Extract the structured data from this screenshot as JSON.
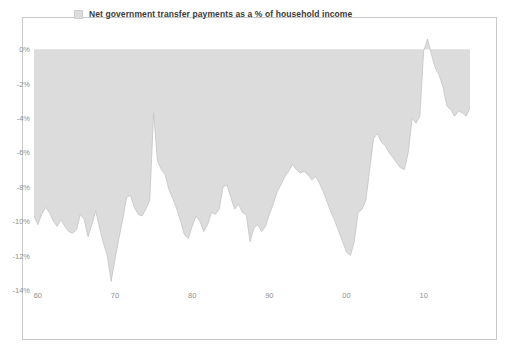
{
  "chart_data": {
    "type": "area",
    "title": "",
    "subtitle": "",
    "xlabel": "",
    "ylabel": "",
    "legend": {
      "position": "top",
      "entries": [
        {
          "name": "Net government transfer payments as a % of household income",
          "color": "#dcdcdc",
          "swatch_icon": "square-swatch"
        }
      ]
    },
    "grid": false,
    "baseline": 0,
    "ylim": [
      -14,
      1
    ],
    "ytick_values": [
      0,
      -2,
      -4,
      -6,
      -8,
      -10,
      -12,
      -14
    ],
    "ytick_labels": [
      "0%",
      "-2%",
      "-4%",
      "-6%",
      "-8%",
      "-10%",
      "-12%",
      "-14%"
    ],
    "xlim": [
      1959.5,
      2016.0
    ],
    "xtick_values": [
      1960,
      1970,
      1980,
      1990,
      2000,
      2010
    ],
    "xtick_labels": [
      "60",
      "70",
      "80",
      "90",
      "00",
      "10"
    ],
    "series": [
      {
        "name": "Net government transfer payments as a % of household income",
        "color": "#dcdcdc",
        "line_color": "#c4c4c4",
        "x": [
          1959.5,
          1960.0,
          1960.5,
          1961.0,
          1961.5,
          1962.0,
          1962.5,
          1963.0,
          1963.5,
          1964.0,
          1964.5,
          1965.0,
          1965.5,
          1966.0,
          1966.5,
          1967.0,
          1967.5,
          1968.0,
          1968.5,
          1969.0,
          1969.5,
          1970.0,
          1970.5,
          1971.0,
          1971.5,
          1972.0,
          1972.5,
          1973.0,
          1973.5,
          1974.0,
          1974.5,
          1975.0,
          1975.5,
          1976.0,
          1976.5,
          1977.0,
          1977.5,
          1978.0,
          1978.5,
          1979.0,
          1979.5,
          1980.0,
          1980.5,
          1981.0,
          1981.5,
          1982.0,
          1982.5,
          1983.0,
          1983.5,
          1984.0,
          1984.5,
          1985.0,
          1985.5,
          1986.0,
          1986.5,
          1987.0,
          1987.5,
          1988.0,
          1988.5,
          1989.0,
          1989.5,
          1990.0,
          1990.5,
          1991.0,
          1991.5,
          1992.0,
          1992.5,
          1993.0,
          1993.5,
          1994.0,
          1994.5,
          1995.0,
          1995.5,
          1996.0,
          1996.5,
          1997.0,
          1997.5,
          1998.0,
          1998.5,
          1999.0,
          1999.5,
          2000.0,
          2000.5,
          2001.0,
          2001.5,
          2002.0,
          2002.5,
          2003.0,
          2003.5,
          2004.0,
          2004.5,
          2005.0,
          2005.5,
          2006.0,
          2006.5,
          2007.0,
          2007.5,
          2008.0,
          2008.5,
          2009.0,
          2009.5,
          2010.0,
          2010.5,
          2011.0,
          2011.5,
          2012.0,
          2012.5,
          2013.0,
          2013.5,
          2014.0,
          2014.5,
          2015.0,
          2015.5,
          2016.0
        ],
        "values": [
          -9.7,
          -10.2,
          -9.6,
          -9.2,
          -9.5,
          -10.0,
          -10.3,
          -9.9,
          -10.3,
          -10.6,
          -10.7,
          -10.5,
          -9.6,
          -9.9,
          -10.9,
          -10.2,
          -9.4,
          -10.4,
          -11.3,
          -12.0,
          -13.5,
          -12.2,
          -11.0,
          -9.9,
          -8.6,
          -8.5,
          -9.2,
          -9.6,
          -9.7,
          -9.3,
          -8.8,
          -3.7,
          -6.5,
          -7.0,
          -7.3,
          -8.2,
          -8.7,
          -9.3,
          -10.0,
          -10.8,
          -11.0,
          -10.3,
          -9.7,
          -10.0,
          -10.6,
          -10.2,
          -9.5,
          -9.6,
          -9.3,
          -8.0,
          -7.9,
          -8.6,
          -9.3,
          -9.0,
          -9.5,
          -9.6,
          -11.2,
          -10.4,
          -10.2,
          -10.6,
          -10.3,
          -9.6,
          -9.0,
          -8.3,
          -7.9,
          -7.4,
          -7.1,
          -6.7,
          -7.0,
          -7.2,
          -7.1,
          -7.3,
          -7.6,
          -7.4,
          -7.8,
          -8.3,
          -8.9,
          -9.5,
          -10.0,
          -10.6,
          -11.2,
          -11.8,
          -12.0,
          -11.2,
          -9.5,
          -9.3,
          -8.8,
          -7.0,
          -5.2,
          -4.9,
          -5.4,
          -5.6,
          -6.0,
          -6.3,
          -6.6,
          -6.9,
          -7.0,
          -6.0,
          -4.0,
          -4.3,
          -3.9,
          -0.1,
          0.6,
          -0.3,
          -1.1,
          -1.5,
          -2.2,
          -3.3,
          -3.5,
          -3.9,
          -3.6,
          -3.7,
          -3.9,
          -3.4
        ]
      }
    ]
  },
  "legend": {
    "label": "Net government transfer payments as a % of household income"
  },
  "axes": {
    "y_labels": [
      "0%",
      "-2%",
      "-4%",
      "-6%",
      "-8%",
      "-10%",
      "-12%",
      "-14%"
    ],
    "x_labels": [
      "60",
      "70",
      "80",
      "90",
      "00",
      "10"
    ]
  },
  "colors": {
    "area_fill": "#dcdcdc",
    "area_line": "#c4c4c4",
    "frame_border": "#c9c9c9",
    "tick_text": "#8f8f8f",
    "legend_text": "#3a3a3a"
  }
}
